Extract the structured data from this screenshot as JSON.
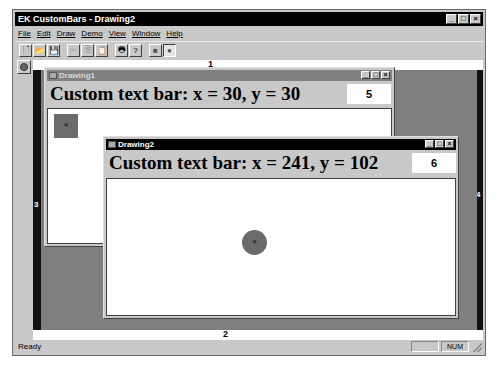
{
  "app": {
    "title": "EK CustomBars - Drawing2",
    "window_buttons": {
      "minimize": "_",
      "maximize": "□",
      "close": "×"
    }
  },
  "menubar": {
    "items": [
      {
        "label": "File"
      },
      {
        "label": "Edit"
      },
      {
        "label": "Draw"
      },
      {
        "label": "Demo"
      },
      {
        "label": "View"
      },
      {
        "label": "Window"
      },
      {
        "label": "Help"
      }
    ]
  },
  "toolbar": {
    "buttons": [
      {
        "name": "new",
        "glyph": "🗋",
        "enabled": true
      },
      {
        "name": "open",
        "glyph": "📂",
        "enabled": true
      },
      {
        "name": "save",
        "glyph": "💾",
        "enabled": true
      },
      {
        "name": "cut",
        "glyph": "✂",
        "enabled": false
      },
      {
        "name": "copy",
        "glyph": "⎘",
        "enabled": false
      },
      {
        "name": "paste",
        "glyph": "📋",
        "enabled": false
      },
      {
        "name": "print",
        "glyph": "🖶",
        "enabled": true
      },
      {
        "name": "help",
        "glyph": "?",
        "enabled": true
      },
      {
        "name": "draw-rectangle",
        "glyph": "■",
        "enabled": true
      },
      {
        "name": "draw-circle",
        "glyph": "●",
        "enabled": true
      }
    ]
  },
  "bars": {
    "top": "1",
    "bottom": "2",
    "left": "3",
    "right": "4"
  },
  "children": [
    {
      "title": "Drawing1",
      "textbar": "Custom text bar: x = 30, y = 30",
      "number": "5",
      "shape": "square",
      "shape_mark": "×"
    },
    {
      "title": "Drawing2",
      "textbar": "Custom text bar: x = 241, y = 102",
      "number": "6",
      "shape": "circle",
      "shape_mark": "×"
    }
  ],
  "statusbar": {
    "text": "Ready",
    "panels": [
      "",
      "NUM",
      ""
    ]
  },
  "colors": {
    "titlebar_active": "#000000",
    "titlebar_inactive": "#808080",
    "shape_fill": "#6b6b6b",
    "mdi_background": "#7f7f7f",
    "face": "#c8c8c8"
  }
}
